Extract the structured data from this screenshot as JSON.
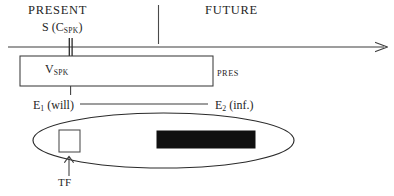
{
  "figure": {
    "type": "timeline-schema-diagram",
    "colors": {
      "stroke": "#3c3c3c",
      "text": "#262626",
      "fill_black": "#101010",
      "fill_white": "#ffffff",
      "background": "#ffffff"
    }
  },
  "labels": {
    "present": "PRESENT",
    "future": "FUTURE",
    "speech_time": {
      "main": "S (C",
      "sub": "SPK",
      "close": ")"
    },
    "viewpoint_box": {
      "main": "V",
      "sub": "SPK"
    },
    "tense": "PRES",
    "event_one": {
      "main": "E",
      "sub": "1",
      "tail": " (will)"
    },
    "event_two": {
      "main": "E",
      "sub": "2",
      "tail": " (inf.)"
    },
    "temporal_frame": "TF"
  },
  "timeline": {
    "axis_y": 47,
    "axis_start_x": 8,
    "axis_end_x": 388,
    "arrowhead": "right-arrow-icon",
    "speech_tick_x": 70,
    "era_divider_x": 158,
    "era_divider_top": 5,
    "era_divider_bottom": 44
  },
  "viewpoint_box": {
    "x": 20,
    "y": 56,
    "width": 193,
    "height": 30,
    "fill": "#ffffff"
  },
  "event_link": {
    "from_x": 78,
    "to_x": 208,
    "y": 104
  },
  "ellipse": {
    "cx": 163.5,
    "cy": 140.5,
    "rx": 130.5,
    "ry": 27.5
  },
  "open_square": {
    "x": 59,
    "y": 130,
    "width": 21,
    "height": 22,
    "fill": "#ffffff"
  },
  "filled_bar": {
    "x": 157,
    "y": 131,
    "width": 98,
    "height": 17,
    "fill": "#101010"
  },
  "tf_arrow": {
    "x": 69,
    "from_y": 175,
    "to_y": 156,
    "direction": "up"
  }
}
